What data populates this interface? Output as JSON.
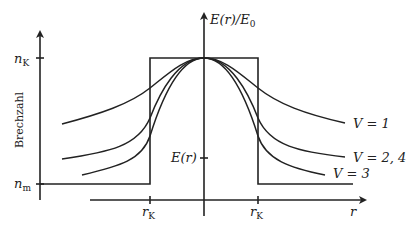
{
  "diagram": {
    "y_axis_label": "Brechzahl",
    "y_ticks": [
      {
        "label_base": "n",
        "label_sub": "K",
        "meaning": "core refractive index"
      },
      {
        "label_base": "n",
        "label_sub": "m",
        "meaning": "cladding refractive index"
      }
    ],
    "field_axis_label": "E(r)/E₀",
    "field_axis": {
      "base": "E(r)/E",
      "sub": "0"
    },
    "field_tick_label": "E(r)",
    "x_axis_label": "r",
    "x_ticks": [
      {
        "label_base": "r",
        "label_sub": "K",
        "side": "left"
      },
      {
        "label_base": "r",
        "label_sub": "K",
        "side": "right"
      }
    ],
    "curves": [
      {
        "name": "V = 1",
        "label": "V = 1"
      },
      {
        "name": "V = 2,4",
        "label": "V = 2, 4"
      },
      {
        "name": "V = 3",
        "label": "V = 3"
      }
    ],
    "profile": "step-index"
  }
}
